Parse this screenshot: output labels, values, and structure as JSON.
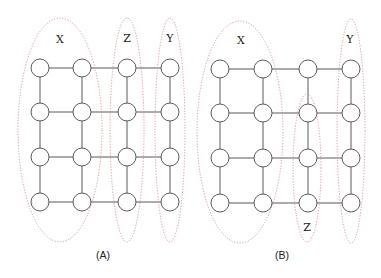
{
  "figure": {
    "ellipse_color": "#d98a8a",
    "panels": [
      {
        "id": "A",
        "caption": "(A)",
        "grid": {
          "rows": 4,
          "cols": 4
        },
        "groups": [
          {
            "name": "X",
            "label": "X",
            "covers_cols": [
              0,
              1
            ],
            "covers_rows": [
              0,
              1,
              2,
              3
            ]
          },
          {
            "name": "Z",
            "label": "Z",
            "covers_cols": [
              2
            ],
            "covers_rows": [
              0,
              1,
              2,
              3
            ]
          },
          {
            "name": "Y",
            "label": "Y",
            "covers_cols": [
              3
            ],
            "covers_rows": [
              0,
              1,
              2,
              3
            ]
          }
        ]
      },
      {
        "id": "B",
        "caption": "(B)",
        "grid": {
          "rows": 4,
          "cols": 4
        },
        "groups": [
          {
            "name": "X",
            "label": "X",
            "covers_cols": [
              0,
              1
            ],
            "covers_rows": [
              0,
              1,
              2,
              3
            ]
          },
          {
            "name": "Z",
            "label": "Z",
            "covers_cols": [
              2
            ],
            "covers_rows": [
              1,
              2,
              3
            ]
          },
          {
            "name": "Y",
            "label": "Y",
            "covers_cols": [
              3
            ],
            "covers_rows": [
              0,
              1,
              2,
              3
            ]
          }
        ]
      }
    ]
  }
}
